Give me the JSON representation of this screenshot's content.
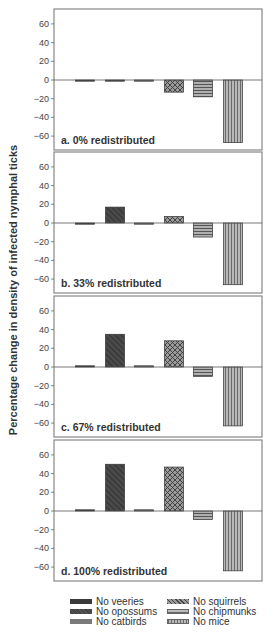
{
  "chart_data": {
    "type": "bar",
    "ylabel": "Percentage change in density of infected nymphal ticks",
    "xlabel": "",
    "ylim": [
      -75,
      75
    ],
    "yticks": [
      60,
      40,
      20,
      0,
      -20,
      -40,
      -60
    ],
    "categories": [
      "No veeries",
      "No opossums",
      "No catbirds",
      "No squirrels",
      "No chipmunks",
      "No mice"
    ],
    "panels": [
      {
        "label": "a. 0% redistributed",
        "values": [
          -1,
          -1,
          -1,
          -13,
          -18,
          -67
        ]
      },
      {
        "label": "b. 33% redistributed",
        "values": [
          -1,
          17,
          -1,
          7,
          -15,
          -66
        ]
      },
      {
        "label": "c. 67% redistributed",
        "values": [
          0,
          35,
          0,
          28,
          -10,
          -63
        ]
      },
      {
        "label": "d. 100% redistributed",
        "values": [
          0,
          50,
          0,
          47,
          -9,
          -64
        ]
      }
    ],
    "legend_position": "bottom"
  },
  "legend": [
    {
      "label": "No veeries",
      "pattern": "solid-dark"
    },
    {
      "label": "No opossums",
      "pattern": "diagonal"
    },
    {
      "label": "No catbirds",
      "pattern": "solid-mid"
    },
    {
      "label": "No squirrels",
      "pattern": "crosshatch"
    },
    {
      "label": "No chipmunks",
      "pattern": "horizontal"
    },
    {
      "label": "No mice",
      "pattern": "vertical"
    }
  ],
  "colors": {
    "veeries": "#3a3a3a",
    "opossums": "#4a4a4a",
    "catbirds": "#7a7a7a",
    "squirrels": "#8a8a8a",
    "chipmunks": "#9a9a9a",
    "mice": "#a8a8a8",
    "frame": "#888888"
  }
}
